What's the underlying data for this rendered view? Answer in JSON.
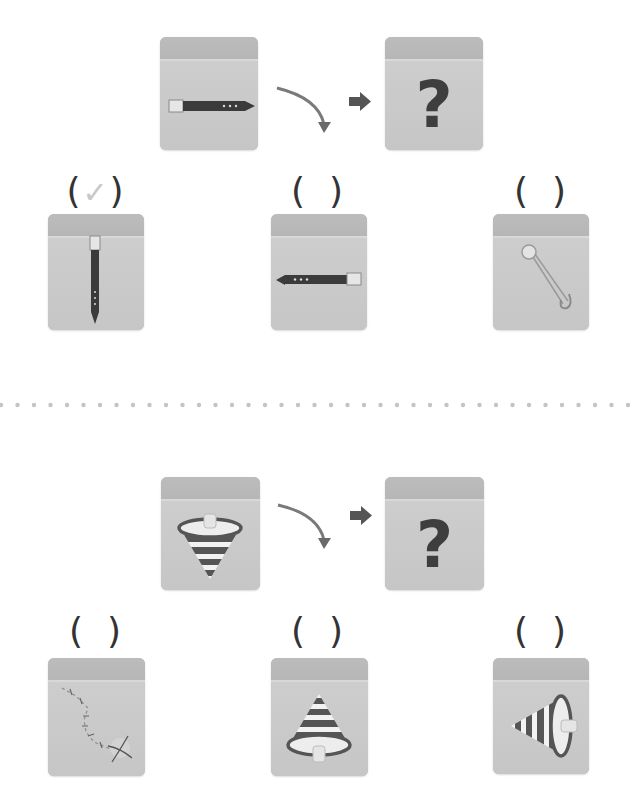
{
  "puzzles": [
    {
      "source_icon": "belt-horizontal-buckle-left",
      "target_label": "?",
      "transform": "rotate-clockwise-90",
      "options": [
        {
          "icon": "belt-vertical-buckle-top",
          "bracket_open": "(",
          "bracket_close": ")",
          "mark": "✓",
          "selected": true
        },
        {
          "icon": "belt-horizontal-buckle-right",
          "bracket_open": "(",
          "bracket_close": ")",
          "mark": "",
          "selected": false
        },
        {
          "icon": "safety-pin",
          "bracket_open": "(",
          "bracket_close": ")",
          "mark": "",
          "selected": false
        }
      ]
    },
    {
      "source_icon": "spinning-top-point-down",
      "target_label": "?",
      "transform": "rotate-clockwise-90",
      "options": [
        {
          "icon": "treasure-map-path",
          "bracket_open": "(",
          "bracket_close": ")",
          "mark": "",
          "selected": false
        },
        {
          "icon": "spinning-top-point-up",
          "bracket_open": "(",
          "bracket_close": ")",
          "mark": "",
          "selected": false
        },
        {
          "icon": "spinning-top-point-left",
          "bracket_open": "(",
          "bracket_close": ")",
          "mark": "",
          "selected": false
        }
      ]
    }
  ],
  "colors": {
    "box": "#c6c6c6",
    "box_top": "#b8b8b8",
    "icon_dark": "#3e3e3e",
    "arrow": "#6e6e6e",
    "check": "#c8c8c8",
    "divider_dot": "#c4c4c4"
  }
}
